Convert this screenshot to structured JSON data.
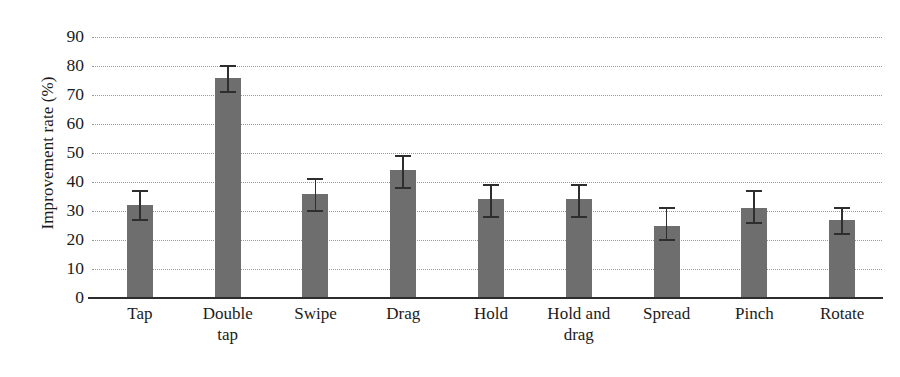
{
  "chart_data": {
    "type": "bar",
    "title": "",
    "subtitle": "",
    "xlabel": "",
    "ylabel": "Improvement rate (%)",
    "ylim": [
      0,
      90
    ],
    "ytick_step": 10,
    "yticks": [
      90,
      80,
      70,
      60,
      50,
      40,
      30,
      20,
      10,
      0
    ],
    "grid": "horizontal-dotted",
    "legend": "none",
    "bar_color": "#6e6e6e",
    "error_color": "#2e2e2e",
    "axis_color": "#2c2c2c",
    "grid_color": "#9a9a9a",
    "categories": [
      "Tap",
      "Double tap",
      "Swipe",
      "Drag",
      "Hold",
      "Hold and drag",
      "Spread",
      "Pinch",
      "Rotate"
    ],
    "category_lines": [
      [
        "Tap"
      ],
      [
        "Double",
        "tap"
      ],
      [
        "Swipe"
      ],
      [
        "Drag"
      ],
      [
        "Hold"
      ],
      [
        "Hold and",
        "drag"
      ],
      [
        "Spread"
      ],
      [
        "Pinch"
      ],
      [
        "Rotate"
      ]
    ],
    "values": [
      32,
      76,
      36,
      44,
      34,
      34,
      25,
      31,
      27
    ],
    "error_upper": [
      37,
      80,
      41,
      49,
      39,
      39,
      31,
      37,
      31
    ],
    "error_lower": [
      27,
      71,
      30,
      38,
      28,
      28,
      20,
      26,
      22
    ],
    "series": [
      {
        "name": "Improvement rate",
        "values": [
          32,
          76,
          36,
          44,
          34,
          34,
          25,
          31,
          27
        ]
      }
    ]
  }
}
